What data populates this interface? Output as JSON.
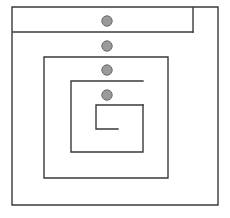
{
  "figure": {
    "type": "rectangular-spiral-diagram",
    "title": "",
    "width": 230,
    "height": 218,
    "background_color": "#ffffff",
    "line_color": "#3a3a3a",
    "line_width": 1.4
  },
  "spiral": {
    "description": "Four-turn rectangular spiral drawn as nested open rectangles winding inward clockwise",
    "turn_count": 4,
    "arms": [
      {
        "index": 0,
        "name": "outer-frame",
        "top": 7,
        "left": 12,
        "right": 218,
        "bottom": 205,
        "path": "M 193 7 L 12 7 L 12 205 L 218 205 L 218 7 L 193 7 L 193 32"
      },
      {
        "index": 1,
        "name": "spiral-arm-1",
        "top": 32,
        "left": 13,
        "right": 193,
        "bottom": 178,
        "path": "M 193 32 L 13 32"
      },
      {
        "index": 2,
        "name": "spiral-arm-2",
        "top": 57,
        "left": 44,
        "right": 168,
        "bottom": 178,
        "path": "M 168 57 L 44 57 L 44 178 L 168 178 L 168 57"
      },
      {
        "index": 3,
        "name": "spiral-arm-3",
        "top": 81,
        "left": 71,
        "right": 143,
        "bottom": 152,
        "path": "M 143 81 L 71 81 L 71 152 L 143 152 L 143 105"
      },
      {
        "index": 4,
        "name": "spiral-arm-4-innermost",
        "top": 105,
        "left": 96,
        "right": 143,
        "bottom": 129,
        "path": "M 143 105 L 96 105 L 96 129 L 118 129"
      }
    ]
  },
  "nodes": {
    "label": "marker dots",
    "count": 4,
    "radius": 5.2,
    "fill_color": "#9a9a9a",
    "stroke_color": "#6b6b6b",
    "items": [
      {
        "index": 0,
        "name": "node-dot-1",
        "cx": 107,
        "cy": 21
      },
      {
        "index": 1,
        "name": "node-dot-2",
        "cx": 107,
        "cy": 46
      },
      {
        "index": 2,
        "name": "node-dot-3",
        "cx": 107,
        "cy": 70
      },
      {
        "index": 3,
        "name": "node-dot-4",
        "cx": 107,
        "cy": 95
      }
    ]
  }
}
